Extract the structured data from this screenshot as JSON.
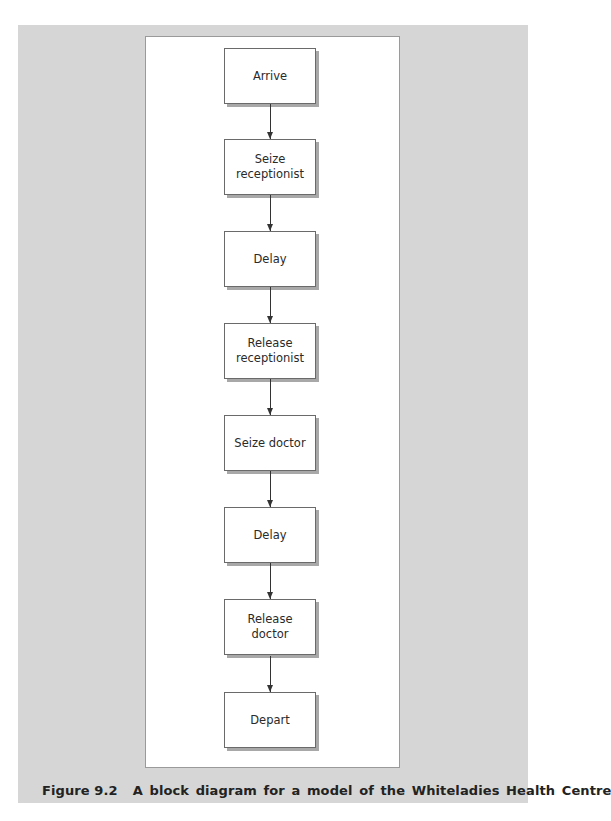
{
  "figure": {
    "label": "Figure 9.2",
    "title": "A block diagram for a model of the Whiteladies Health Centre"
  },
  "blocks": [
    {
      "label": "Arrive"
    },
    {
      "label": "Seize receptionist"
    },
    {
      "label": "Delay"
    },
    {
      "label": "Release receptionist"
    },
    {
      "label": "Seize doctor"
    },
    {
      "label": "Delay"
    },
    {
      "label": "Release doctor"
    },
    {
      "label": "Depart"
    }
  ],
  "colors": {
    "background_band": "#d6d6d6",
    "panel": "#ffffff",
    "block_border": "#6a6a6a",
    "block_shadow": "#a8a8a8",
    "arrow": "#333333"
  }
}
